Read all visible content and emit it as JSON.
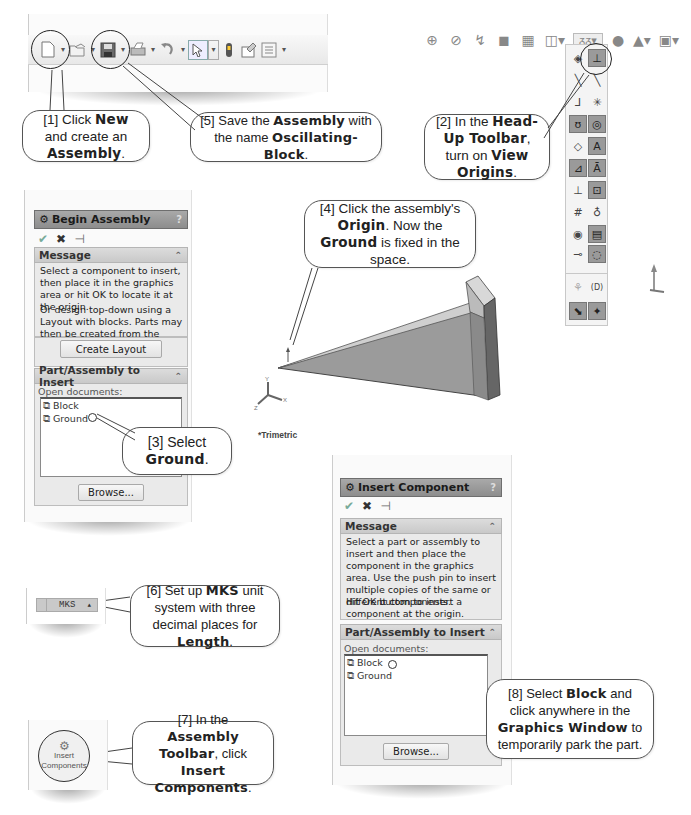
{
  "toolbar": {
    "icons": [
      {
        "name": "new-document-icon",
        "glyph": "🗋",
        "dropdown": true
      },
      {
        "name": "open-icon",
        "glyph": "📂",
        "dropdown": true
      },
      {
        "name": "save-icon",
        "glyph": "💾",
        "dropdown": true
      },
      {
        "name": "print-icon",
        "glyph": "🖶",
        "dropdown": true
      },
      {
        "name": "undo-icon",
        "glyph": "↶",
        "dropdown": true
      },
      {
        "name": "select-icon",
        "glyph": "⇖",
        "dropdown": true
      },
      {
        "name": "rebuild-icon",
        "glyph": "▮",
        "dropdown": false
      },
      {
        "name": "file-properties-icon",
        "glyph": "⌂",
        "dropdown": false
      },
      {
        "name": "options-icon",
        "glyph": "☰",
        "dropdown": true
      }
    ]
  },
  "callouts": {
    "c1": {
      "pre": "[1] Click ",
      "b1": "New",
      "mid": " and create an ",
      "b2": "Assembly",
      "post": "."
    },
    "c2": {
      "pre": "[2] In the ",
      "b1": "Head-Up Toolbar",
      "mid": ", turn on ",
      "b2": "View Origins",
      "post": "."
    },
    "c3": {
      "pre": "[3] Select ",
      "b1": "Ground",
      "post": "."
    },
    "c4": {
      "pre": "[4] Click the assembly's ",
      "b1": "Origin",
      "mid": ".  Now the ",
      "b2": "Ground",
      "post": " is fixed in the space."
    },
    "c5": {
      "pre": "[5] Save the ",
      "b1": "Assembly",
      "mid": " with the name ",
      "b2": "Oscillating-Block",
      "post": "."
    },
    "c6": {
      "pre": "[6] Set up ",
      "b1": "MKS",
      "mid": " unit system with three decimal places for ",
      "b2": "Length",
      "post": "."
    },
    "c7": {
      "pre": "[7] In the ",
      "b1": "Assembly Toolbar",
      "mid": ", click ",
      "b2": "Insert Components",
      "post": "."
    },
    "c8": {
      "pre": "[8] Select ",
      "b1": "Block",
      "mid": " and click anywhere in the ",
      "b2": "Graphics Window",
      "post": " to temporarily park the part."
    }
  },
  "begin_assembly": {
    "title": "Begin Assembly",
    "help": "?",
    "message_header": "Message",
    "message_p1": "Select a component to insert, then place it in the graphics area or hit OK to locate it at the origin.",
    "message_p2": "Or design top-down using a Layout with blocks. Parts may then be created from the blocks.",
    "create_layout": "Create Layout",
    "section_header": "Part/Assembly to Insert",
    "open_docs_label": "Open documents:",
    "docs": [
      "Block",
      "Ground"
    ],
    "browse": "Browse..."
  },
  "insert_component": {
    "title": "Insert Component",
    "help": "?",
    "message_header": "Message",
    "message_p1": "Select a part or assembly to insert and then place the component in the graphics area. Use the push pin to insert multiple copies of the same or different components.",
    "message_p2": "Hit OK button to insert a component at the origin.",
    "section_header": "Part/Assembly to Insert",
    "open_docs_label": "Open documents:",
    "docs": [
      "Block",
      "Ground"
    ],
    "browse": "Browse..."
  },
  "viewport": {
    "view_label": "*Trimetric",
    "axes": {
      "x": "X",
      "y": "Y",
      "z": "Z"
    }
  },
  "units": {
    "value": "MKS",
    "arrow": "▲"
  },
  "assembly_toolbar": {
    "insert_components": "Insert Components"
  },
  "hud": {
    "row_icons": [
      "zoom-to-fit-icon",
      "zoom-area-icon",
      "previous-view-icon",
      "section-view-icon",
      "view-orientation-icon",
      "display-style-icon",
      "hide-show-items-icon",
      "edit-appearance-icon",
      "apply-scene-icon",
      "view-settings-icon"
    ],
    "panel_label_dim": "(D)"
  }
}
